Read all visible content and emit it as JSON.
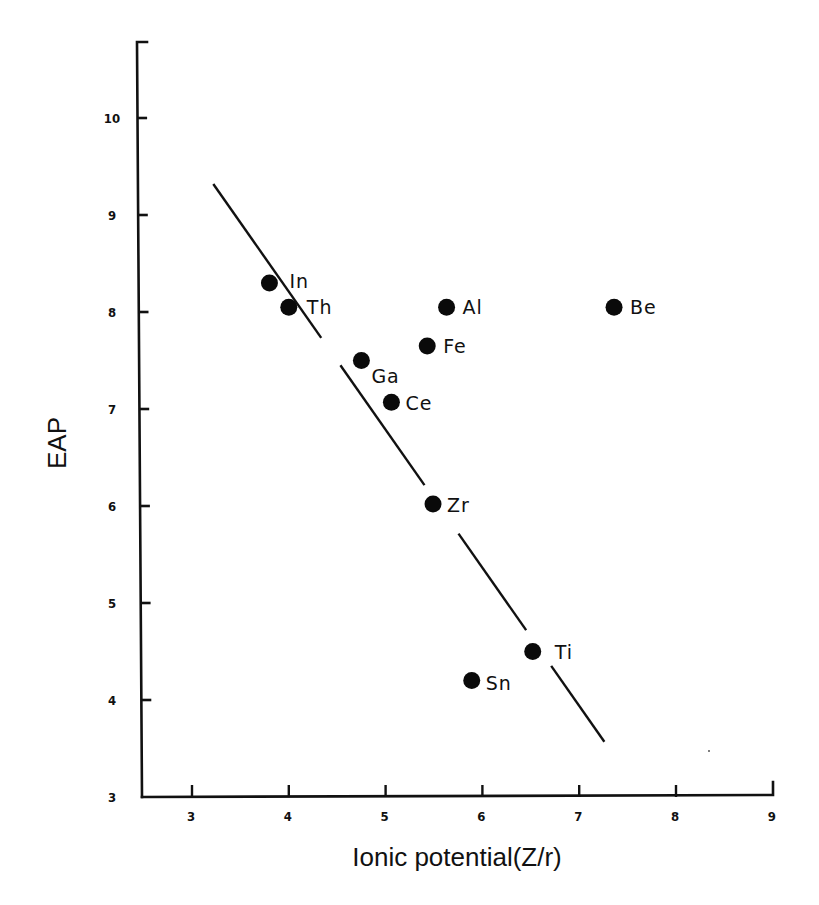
{
  "chart_data": {
    "type": "scatter",
    "title": "",
    "xlabel": "Ionic potential(Z/r)",
    "ylabel": "EAP",
    "xlim": [
      2.5,
      9
    ],
    "ylim": [
      3,
      10.8
    ],
    "xticks": [
      "3",
      "4",
      "5",
      "6",
      "7",
      "8",
      "9"
    ],
    "yticks": [
      "3",
      "4",
      "5",
      "6",
      "7",
      "8",
      "9",
      "10"
    ],
    "grid": false,
    "legend": null,
    "series": [
      {
        "name": "elements",
        "points": [
          {
            "label": "In",
            "x": 3.8,
            "y": 8.3
          },
          {
            "label": "Th",
            "x": 4.0,
            "y": 8.05
          },
          {
            "label": "Al",
            "x": 5.63,
            "y": 8.05
          },
          {
            "label": "Be",
            "x": 7.36,
            "y": 8.05
          },
          {
            "label": "Fe",
            "x": 5.43,
            "y": 7.65
          },
          {
            "label": "Ga",
            "x": 4.75,
            "y": 7.5
          },
          {
            "label": "Ce",
            "x": 5.06,
            "y": 7.07
          },
          {
            "label": "Zr",
            "x": 5.49,
            "y": 6.02
          },
          {
            "label": "Ti",
            "x": 6.52,
            "y": 4.5
          },
          {
            "label": "Sn",
            "x": 5.89,
            "y": 4.2
          }
        ]
      }
    ],
    "trend_line": {
      "style": "broken solid segments",
      "start": {
        "x": 3.22,
        "y": 9.32
      },
      "end": {
        "x": 7.26,
        "y": 3.57
      }
    }
  },
  "axes": {
    "x_title": "Ionic potential(Z/r)",
    "y_title": "EAP"
  }
}
